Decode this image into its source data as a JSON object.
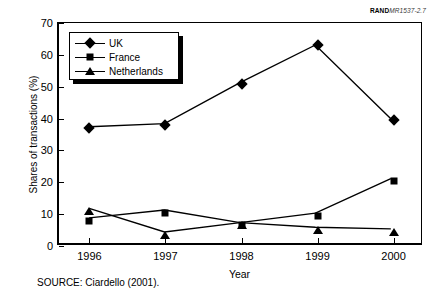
{
  "figure": {
    "rand_tag_bold": "RAND",
    "rand_tag_italic": "MR1537-2.7",
    "source_note": "SOURCE: Ciardello (2001)."
  },
  "chart_data": {
    "type": "line",
    "title": "",
    "xlabel": "Year",
    "ylabel": "Shares of transactions (%)",
    "categories": [
      "1996",
      "1997",
      "1998",
      "1999",
      "2000"
    ],
    "x": [
      1996,
      1997,
      1998,
      1999,
      2000
    ],
    "xlim": [
      1995.6,
      2000.4
    ],
    "ylim": [
      0,
      70
    ],
    "yticks": [
      0,
      10,
      20,
      30,
      40,
      50,
      60,
      70
    ],
    "ytick_labels": [
      "0",
      "10",
      "20",
      "30",
      "40",
      "50",
      "60",
      "70"
    ],
    "grid": false,
    "legend_position": "upper-left",
    "series": [
      {
        "name": "UK",
        "marker": "diamond",
        "values": [
          37,
          38,
          51,
          63,
          39.5
        ]
      },
      {
        "name": "France",
        "marker": "square",
        "values": [
          8,
          10.5,
          6.5,
          9.5,
          20.5
        ]
      },
      {
        "name": "Netherlands",
        "marker": "triangle",
        "values": [
          11,
          3.5,
          6.5,
          5,
          4.5
        ]
      }
    ],
    "colors": {
      "series": "#000000",
      "axis": "#000000",
      "background": "#ffffff"
    }
  }
}
